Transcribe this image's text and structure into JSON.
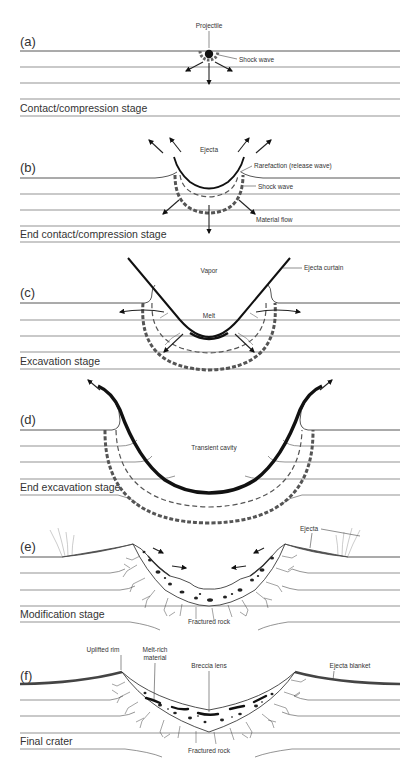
{
  "figure": {
    "panels": [
      {
        "id": "a",
        "letter": "(a)",
        "stage": "Contact/compression stage",
        "labels": {
          "projectile": "Projectile",
          "shock_wave": "Shock wave"
        }
      },
      {
        "id": "b",
        "letter": "(b)",
        "stage": "End contact/compression stage",
        "labels": {
          "ejecta": "Ejecta",
          "rarefaction": "Rarefaction (release wave)",
          "shock_wave": "Shock wave",
          "material_flow": "Material flow"
        }
      },
      {
        "id": "c",
        "letter": "(c)",
        "stage": "Excavation stage",
        "labels": {
          "vapor": "Vapor",
          "ejecta_curtain": "Ejecta curtain",
          "melt": "Melt"
        }
      },
      {
        "id": "d",
        "letter": "(d)",
        "stage": "End excavation stage",
        "labels": {
          "transient_cavity": "Transient cavity"
        }
      },
      {
        "id": "e",
        "letter": "(e)",
        "stage": "Modification stage",
        "labels": {
          "ejecta": "Ejecta",
          "fractured_rock": "Fractured rock"
        }
      },
      {
        "id": "f",
        "letter": "(f)",
        "stage": "Final crater",
        "labels": {
          "uplifted_rim": "Uplifted rim",
          "melt_rich_1": "Melt-rich",
          "melt_rich_2": "material",
          "breccia_lens": "Breccia lens",
          "ejecta_blanket": "Ejecta blanket",
          "fractured_rock": "Fractured rock"
        }
      }
    ],
    "colors": {
      "line": "#666666",
      "ink": "#111111",
      "shock": "#555555",
      "ejecta": "#555555",
      "background": "#ffffff"
    }
  }
}
